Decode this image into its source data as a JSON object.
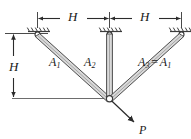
{
  "figure": {
    "stroke_color": "#3b3b3b",
    "fill_color": "#d9d9d9",
    "text_color": "#1a1a1a",
    "labels": {
      "dim_top_left": "H",
      "dim_top_right": "H",
      "dim_left_vertical": "H",
      "member_1": "A",
      "member_1_sub": "1",
      "member_2": "A",
      "member_2_sub": "2",
      "member_3": "A",
      "member_3_sub": "3",
      "member_3_equals": "=",
      "member_3_rhs": "A",
      "member_3_rhs_sub": "1",
      "load": "P"
    },
    "geometry": {
      "support_left": [
        37,
        33
      ],
      "support_middle": [
        109,
        33
      ],
      "support_right": [
        181,
        33
      ],
      "joint": [
        109,
        98
      ],
      "load_arrow_tip": [
        136,
        124
      ],
      "dim_span": "H",
      "dim_height": "H"
    }
  }
}
